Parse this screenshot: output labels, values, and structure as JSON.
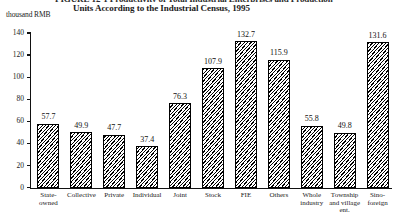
{
  "figure": {
    "title_line1": "FIGURE 12-1 Productivity of Total Industrial Enterprises and Production",
    "title_line2": "Units According to the Industrial Census, 1995",
    "y_unit_label": "thousand RMB"
  },
  "chart_data": {
    "type": "bar",
    "title": "FIGURE 12-1 Productivity of Total Industrial Enterprises and Production Units According to the Industrial Census, 1995",
    "xlabel": "",
    "ylabel": "thousand RMB",
    "ylim": [
      0,
      140
    ],
    "yticks": [
      0,
      20,
      40,
      60,
      80,
      100,
      120,
      140
    ],
    "grid": false,
    "legend": "none",
    "categories": [
      "State-owned",
      "Collective",
      "Private",
      "Individual",
      "Joint",
      "Stock",
      "FIE",
      "Others",
      "Whole industry",
      "Township and village ent.",
      "Sino-foreign"
    ],
    "category_lines": [
      [
        "State-",
        "owned"
      ],
      [
        "Collective"
      ],
      [
        "Private"
      ],
      [
        "Individual"
      ],
      [
        "Joint"
      ],
      [
        "Stock"
      ],
      [
        "FIE"
      ],
      [
        "Others"
      ],
      [
        "Whole",
        "industry"
      ],
      [
        "Township",
        "and village",
        "ent."
      ],
      [
        "Sino-",
        "foreign"
      ]
    ],
    "values": [
      57.7,
      49.9,
      47.7,
      37.4,
      76.3,
      107.9,
      132.7,
      115.9,
      55.8,
      49.8,
      131.6
    ],
    "value_labels": [
      "57.7",
      "49.9",
      "47.7",
      "37.4",
      "76.3",
      "107.9",
      "132.7",
      "115.9",
      "55.8",
      "49.8",
      "131.6"
    ],
    "bar_style": {
      "fill": "diagonal-hatch",
      "edge_color": "#000000",
      "face_color": "#ffffff"
    }
  }
}
